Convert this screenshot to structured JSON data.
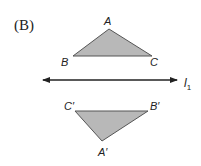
{
  "option_label": "(B)",
  "line": {
    "label": "l",
    "subscript": "1",
    "x1": 41,
    "x2": 179,
    "y": 80
  },
  "triangle_original": {
    "vertices": {
      "A": {
        "label": "A",
        "x": 109,
        "y": 29
      },
      "B": {
        "label": "B",
        "x": 73,
        "y": 56
      },
      "C": {
        "label": "C",
        "x": 152,
        "y": 56
      }
    },
    "fill": "#b8b8b8",
    "stroke": "#555555"
  },
  "triangle_reflected": {
    "vertices": {
      "A": {
        "label": "A′",
        "x": 102,
        "y": 141
      },
      "B": {
        "label": "B′",
        "x": 148,
        "y": 111
      },
      "C": {
        "label": "C′",
        "x": 75,
        "y": 111
      }
    },
    "fill": "#b8b8b8",
    "stroke": "#555555"
  }
}
